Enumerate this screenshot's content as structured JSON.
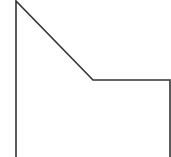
{
  "canvas": {
    "width": 171,
    "height": 157,
    "background": "#ffffff"
  },
  "stroke": {
    "color": "#333333",
    "width": 1.6
  },
  "shape": {
    "type": "open-polyline",
    "points": [
      [
        16,
        157
      ],
      [
        16,
        1
      ],
      [
        93,
        80
      ],
      [
        170,
        80
      ],
      [
        170,
        157
      ]
    ]
  }
}
